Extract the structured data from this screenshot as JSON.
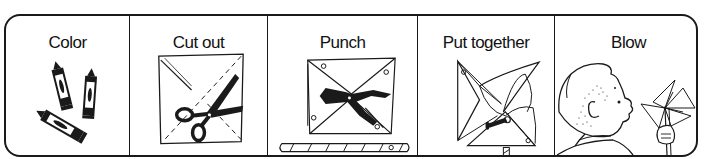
{
  "steps": [
    {
      "label": "Color",
      "icon": "crayons-icon"
    },
    {
      "label": "Cut out",
      "icon": "scissors-icon"
    },
    {
      "label": "Punch",
      "icon": "hole-punch-icon"
    },
    {
      "label": "Put together",
      "icon": "pinwheel-assembly-icon"
    },
    {
      "label": "Blow",
      "icon": "child-blowing-pinwheel-icon"
    }
  ],
  "colors": {
    "ink": "#1a1a1a",
    "background": "#ffffff"
  }
}
